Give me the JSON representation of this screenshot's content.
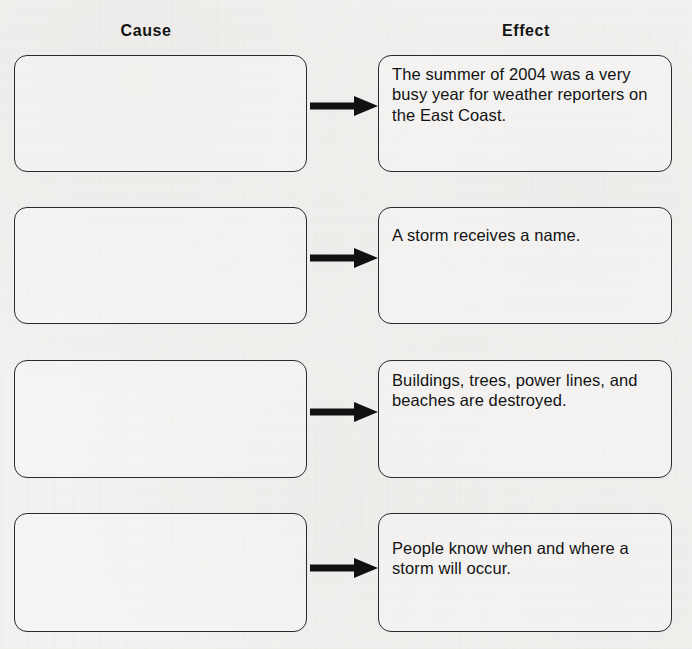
{
  "worksheet": {
    "columns": {
      "cause_label": "Cause",
      "effect_label": "Effect"
    },
    "ink_color": "#2a2a2a",
    "paper_color": "#f3f2f0",
    "rows": [
      {
        "cause": "",
        "effect": "The summer of 2004 was a very busy year for weather reporters on the East Coast.",
        "arrow": "right-arrow-icon"
      },
      {
        "cause": "",
        "effect": "A storm receives a name.",
        "arrow": "right-arrow-icon"
      },
      {
        "cause": "",
        "effect": "Buildings, trees, power lines, and beaches are destroyed.",
        "arrow": "right-arrow-icon"
      },
      {
        "cause": "",
        "effect": "People know when and where a storm will occur.",
        "arrow": "right-arrow-icon"
      }
    ]
  }
}
